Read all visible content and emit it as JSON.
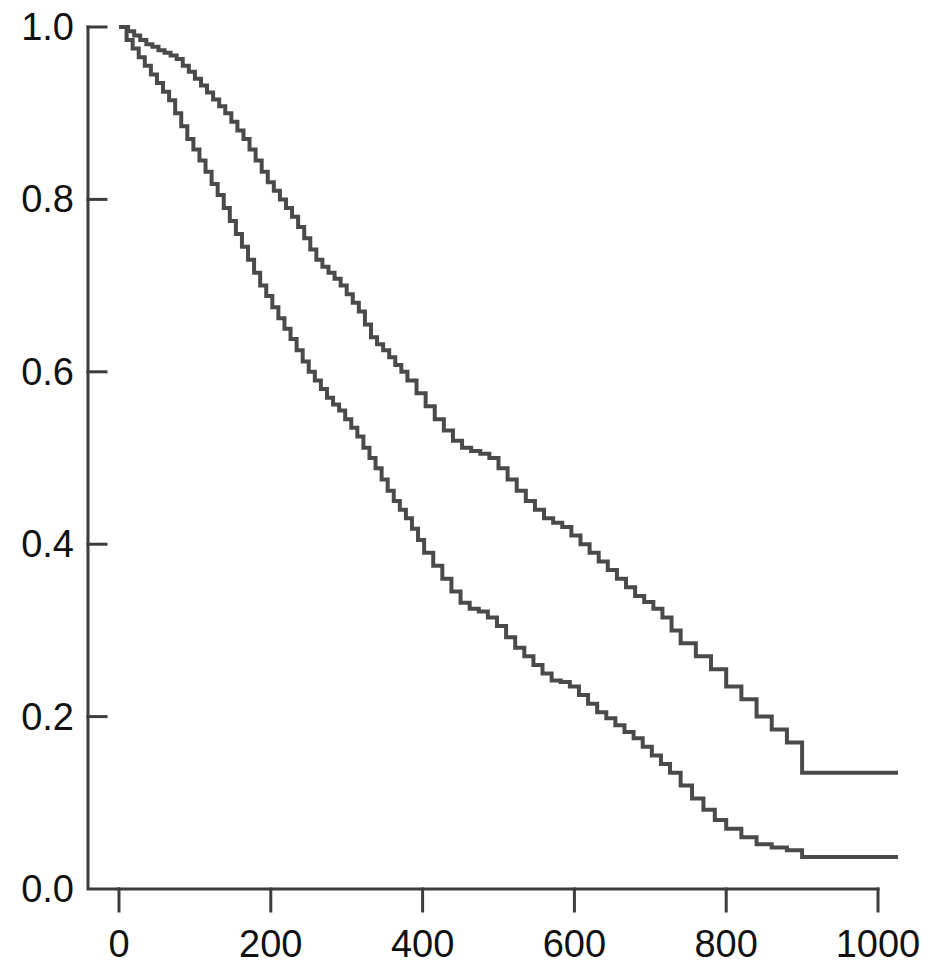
{
  "chart_data": {
    "type": "line",
    "title": "",
    "subtitle": "",
    "xlabel": "",
    "ylabel": "",
    "xlim": [
      0,
      1000
    ],
    "ylim": [
      0.0,
      1.0
    ],
    "grid": false,
    "legend": "none",
    "plot_style": "kaplan-meier step survival curves, two groups, no legend, no axis titles",
    "x_ticks": [
      0,
      200,
      400,
      600,
      800,
      1000
    ],
    "x_tick_labels": [
      "0",
      "200",
      "400",
      "600",
      "800",
      "1000"
    ],
    "y_ticks": [
      0.0,
      0.2,
      0.4,
      0.6,
      0.8,
      1.0
    ],
    "y_tick_labels": [
      "0.0",
      "0.2",
      "0.4",
      "0.6",
      "0.8",
      "1.0"
    ],
    "line_color": "#4a4a4a",
    "axis_color": "#3c3c3c",
    "background_color": "#ffffff",
    "series": [
      {
        "name": "upper-curve",
        "final_value": 0.135,
        "step": "post",
        "x": [
          0,
          12,
          20,
          28,
          36,
          44,
          52,
          60,
          68,
          76,
          84,
          92,
          100,
          108,
          116,
          124,
          132,
          140,
          148,
          156,
          164,
          172,
          180,
          188,
          196,
          204,
          212,
          220,
          228,
          236,
          244,
          252,
          260,
          268,
          276,
          284,
          292,
          300,
          308,
          316,
          324,
          332,
          340,
          348,
          356,
          364,
          372,
          380,
          392,
          404,
          416,
          428,
          440,
          452,
          464,
          476,
          488,
          500,
          512,
          524,
          536,
          548,
          560,
          572,
          584,
          596,
          608,
          620,
          632,
          644,
          656,
          668,
          680,
          692,
          704,
          716,
          728,
          740,
          760,
          780,
          800,
          820,
          840,
          860,
          880,
          900,
          1000
        ],
        "y": [
          1.0,
          0.995,
          0.99,
          0.985,
          0.98,
          0.977,
          0.973,
          0.97,
          0.967,
          0.963,
          0.955,
          0.948,
          0.94,
          0.932,
          0.924,
          0.916,
          0.908,
          0.9,
          0.89,
          0.88,
          0.87,
          0.858,
          0.845,
          0.832,
          0.82,
          0.81,
          0.8,
          0.79,
          0.78,
          0.768,
          0.755,
          0.742,
          0.73,
          0.722,
          0.715,
          0.708,
          0.7,
          0.69,
          0.68,
          0.67,
          0.655,
          0.64,
          0.632,
          0.625,
          0.617,
          0.608,
          0.6,
          0.59,
          0.575,
          0.56,
          0.545,
          0.532,
          0.52,
          0.512,
          0.508,
          0.505,
          0.5,
          0.488,
          0.475,
          0.462,
          0.45,
          0.44,
          0.43,
          0.425,
          0.42,
          0.41,
          0.4,
          0.39,
          0.38,
          0.37,
          0.36,
          0.35,
          0.34,
          0.333,
          0.325,
          0.315,
          0.3,
          0.285,
          0.27,
          0.255,
          0.235,
          0.22,
          0.2,
          0.185,
          0.17,
          0.135,
          0.135
        ]
      },
      {
        "name": "lower-curve",
        "final_value": 0.037,
        "step": "post",
        "x": [
          0,
          10,
          18,
          26,
          34,
          42,
          50,
          58,
          66,
          74,
          82,
          90,
          98,
          106,
          114,
          122,
          130,
          138,
          146,
          154,
          162,
          170,
          178,
          186,
          194,
          202,
          210,
          218,
          226,
          234,
          242,
          250,
          258,
          266,
          274,
          282,
          290,
          298,
          306,
          314,
          322,
          330,
          338,
          346,
          354,
          362,
          370,
          378,
          386,
          394,
          402,
          414,
          426,
          438,
          450,
          462,
          474,
          486,
          498,
          510,
          522,
          534,
          546,
          558,
          570,
          582,
          594,
          606,
          618,
          630,
          642,
          654,
          666,
          678,
          690,
          702,
          714,
          726,
          740,
          755,
          770,
          785,
          800,
          820,
          840,
          860,
          880,
          900,
          1000
        ],
        "y": [
          1.0,
          0.985,
          0.975,
          0.965,
          0.955,
          0.945,
          0.935,
          0.925,
          0.915,
          0.9,
          0.885,
          0.87,
          0.858,
          0.845,
          0.832,
          0.818,
          0.805,
          0.79,
          0.775,
          0.76,
          0.745,
          0.73,
          0.715,
          0.7,
          0.688,
          0.675,
          0.662,
          0.65,
          0.638,
          0.625,
          0.612,
          0.6,
          0.59,
          0.58,
          0.57,
          0.562,
          0.555,
          0.545,
          0.535,
          0.525,
          0.512,
          0.5,
          0.488,
          0.475,
          0.462,
          0.45,
          0.44,
          0.43,
          0.418,
          0.405,
          0.39,
          0.375,
          0.36,
          0.345,
          0.332,
          0.325,
          0.322,
          0.315,
          0.305,
          0.292,
          0.28,
          0.27,
          0.26,
          0.25,
          0.242,
          0.24,
          0.235,
          0.225,
          0.215,
          0.205,
          0.198,
          0.19,
          0.182,
          0.175,
          0.165,
          0.155,
          0.145,
          0.135,
          0.12,
          0.105,
          0.092,
          0.08,
          0.07,
          0.06,
          0.052,
          0.048,
          0.045,
          0.037,
          0.037
        ]
      }
    ]
  },
  "axes": {
    "x_axis_name": "time-axis",
    "y_axis_name": "survival-probability-axis"
  }
}
